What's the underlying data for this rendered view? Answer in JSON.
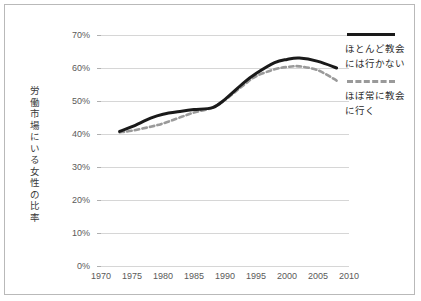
{
  "chart_data": {
    "type": "line",
    "title": "",
    "xlabel": "",
    "ylabel": "労働市場にいる女性の比率",
    "xlim": [
      1970,
      2010
    ],
    "ylim": [
      0,
      70
    ],
    "grid": true,
    "legend_position": "right",
    "x_ticks": [
      "1970",
      "1975",
      "1980",
      "1985",
      "1990",
      "1995",
      "2000",
      "2005",
      "2010"
    ],
    "y_ticks": [
      "0%",
      "10%",
      "20%",
      "30%",
      "40%",
      "50%",
      "60%",
      "70%"
    ],
    "x": [
      1973,
      1975,
      1978,
      1980,
      1983,
      1985,
      1988,
      1990,
      1993,
      1995,
      1998,
      2000,
      2002,
      2005,
      2008
    ],
    "series": [
      {
        "name": "ほとんど教会\nには行かない",
        "style": "solid",
        "color": "#1a1a1a",
        "values": [
          40.8,
          42.2,
          44.8,
          46.0,
          46.9,
          47.4,
          48.0,
          50.5,
          55.5,
          58.3,
          61.6,
          62.6,
          63.0,
          62.0,
          60.0
        ]
      },
      {
        "name": "ほぼ常に教会\nに行く",
        "style": "dashed",
        "color": "#9a9a9a",
        "values": [
          40.5,
          41.0,
          42.2,
          43.2,
          45.2,
          46.5,
          48.0,
          50.3,
          54.8,
          57.5,
          59.6,
          60.3,
          60.5,
          59.3,
          56.2
        ]
      }
    ],
    "colors": {
      "axis_text": "#5a5a5a",
      "gridline": "#d6d6d6",
      "border": "#b9b9b9",
      "background": "#ffffff",
      "series_solid": "#1a1a1a",
      "series_dashed": "#9a9a9a"
    }
  },
  "legend": {
    "entries": [
      {
        "label": "ほとんど教会\nには行かない",
        "style": "solid"
      },
      {
        "label": "ほぼ常に教会\nに行く",
        "style": "dashed"
      }
    ]
  },
  "axis": {
    "y_title": "労働市場にいる女性の比率"
  }
}
